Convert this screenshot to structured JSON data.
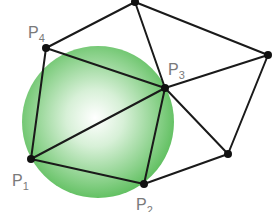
{
  "diagram": {
    "colors": {
      "circle_edge": "#5fbf5f",
      "circle_center": "#ffffff",
      "edge": "#1a1a1a",
      "node": "#111111",
      "label": "#7a7a7a"
    },
    "circle": {
      "cx": 98,
      "cy": 122,
      "r": 76,
      "highlight_x": 95,
      "highlight_y": 118
    },
    "nodes": [
      {
        "id": "P1",
        "x": 31,
        "y": 159,
        "label": "P",
        "sub": "1",
        "lx": 12,
        "ly": 186
      },
      {
        "id": "P2",
        "x": 144,
        "y": 184,
        "label": "P",
        "sub": "2",
        "lx": 136,
        "ly": 210
      },
      {
        "id": "P3",
        "x": 165,
        "y": 88,
        "label": "P",
        "sub": "3",
        "lx": 168,
        "ly": 75
      },
      {
        "id": "P4",
        "x": 46,
        "y": 48,
        "label": "P",
        "sub": "4",
        "lx": 28,
        "ly": 38
      },
      {
        "id": "T",
        "x": 135,
        "y": 2
      },
      {
        "id": "R",
        "x": 268,
        "y": 55
      },
      {
        "id": "B",
        "x": 228,
        "y": 154
      }
    ],
    "edges": [
      [
        "P4",
        "T"
      ],
      [
        "P4",
        "P3"
      ],
      [
        "P4",
        "P1"
      ],
      [
        "T",
        "P3"
      ],
      [
        "T",
        "R"
      ],
      [
        "R",
        "P3"
      ],
      [
        "R",
        "B"
      ],
      [
        "P3",
        "P1"
      ],
      [
        "P3",
        "P2"
      ],
      [
        "P3",
        "B"
      ],
      [
        "P1",
        "P2"
      ],
      [
        "P2",
        "B"
      ]
    ],
    "labels": {
      "P1": {
        "main": "P",
        "sub": "1"
      },
      "P2": {
        "main": "P",
        "sub": "2"
      },
      "P3": {
        "main": "P",
        "sub": "3"
      },
      "P4": {
        "main": "P",
        "sub": "4"
      }
    }
  }
}
